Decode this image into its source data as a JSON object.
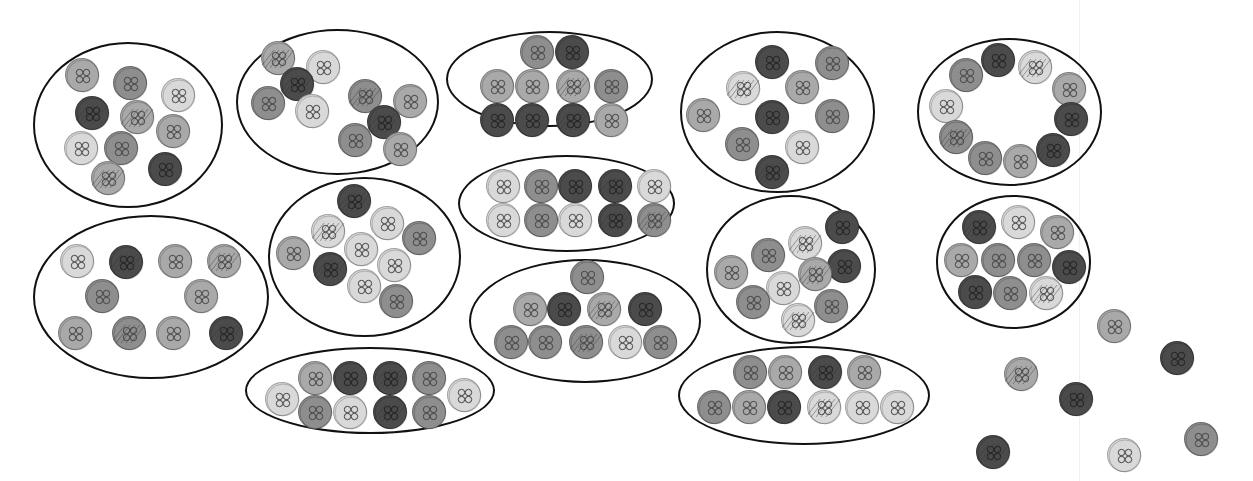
{
  "palette": {
    "light": "#d9d9d9",
    "medium": "#a9a9a9",
    "medium_dark": "#8e8e8e",
    "dark": "#4b4b4b",
    "outline": "#111111",
    "background": "#ffffff"
  },
  "groups": [
    {
      "name": "group-1",
      "oval": {
        "x": 33,
        "y": 42,
        "w": 190,
        "h": 166
      },
      "count": 10
    },
    {
      "name": "group-2",
      "oval": {
        "x": 236,
        "y": 29,
        "w": 203,
        "h": 146
      },
      "count": 10
    },
    {
      "name": "group-3",
      "oval": {
        "x": 446,
        "y": 31,
        "w": 207,
        "h": 96
      },
      "count": 10
    },
    {
      "name": "group-4",
      "oval": {
        "x": 680,
        "y": 31,
        "w": 195,
        "h": 162
      },
      "count": 10
    },
    {
      "name": "group-5",
      "oval": {
        "x": 917,
        "y": 38,
        "w": 185,
        "h": 148
      },
      "count": 10
    },
    {
      "name": "group-6",
      "oval": {
        "x": 33,
        "y": 215,
        "w": 236,
        "h": 164
      },
      "count": 10
    },
    {
      "name": "group-7",
      "oval": {
        "x": 268,
        "y": 177,
        "w": 193,
        "h": 160
      },
      "count": 10
    },
    {
      "name": "group-8",
      "oval": {
        "x": 458,
        "y": 155,
        "w": 217,
        "h": 97
      },
      "count": 10
    },
    {
      "name": "group-9",
      "oval": {
        "x": 469,
        "y": 259,
        "w": 232,
        "h": 124
      },
      "count": 10
    },
    {
      "name": "group-10",
      "oval": {
        "x": 706,
        "y": 195,
        "w": 170,
        "h": 149
      },
      "count": 10
    },
    {
      "name": "group-11",
      "oval": {
        "x": 936,
        "y": 195,
        "w": 155,
        "h": 134
      },
      "count": 10
    },
    {
      "name": "group-12",
      "oval": {
        "x": 245,
        "y": 347,
        "w": 250,
        "h": 87
      },
      "count": 10
    },
    {
      "name": "group-13",
      "oval": {
        "x": 678,
        "y": 346,
        "w": 252,
        "h": 99
      },
      "count": 10
    }
  ],
  "buttons": [
    {
      "x": 82,
      "y": 75,
      "shade": "medium",
      "pattern": false
    },
    {
      "x": 130,
      "y": 83,
      "shade": "medium_dark",
      "pattern": false
    },
    {
      "x": 178,
      "y": 95,
      "shade": "light",
      "pattern": false
    },
    {
      "x": 92,
      "y": 113,
      "shade": "dark",
      "pattern": true
    },
    {
      "x": 137,
      "y": 117,
      "shade": "medium",
      "pattern": true
    },
    {
      "x": 173,
      "y": 131,
      "shade": "medium",
      "pattern": false
    },
    {
      "x": 81,
      "y": 148,
      "shade": "light",
      "pattern": false
    },
    {
      "x": 121,
      "y": 148,
      "shade": "medium_dark",
      "pattern": false
    },
    {
      "x": 108,
      "y": 178,
      "shade": "medium",
      "pattern": true
    },
    {
      "x": 165,
      "y": 169,
      "shade": "dark",
      "pattern": false
    },
    {
      "x": 278,
      "y": 58,
      "shade": "medium",
      "pattern": true
    },
    {
      "x": 323,
      "y": 67,
      "shade": "light",
      "pattern": false
    },
    {
      "x": 297,
      "y": 84,
      "shade": "dark",
      "pattern": true
    },
    {
      "x": 268,
      "y": 103,
      "shade": "medium_dark",
      "pattern": false
    },
    {
      "x": 312,
      "y": 111,
      "shade": "light",
      "pattern": false
    },
    {
      "x": 365,
      "y": 96,
      "shade": "medium_dark",
      "pattern": true
    },
    {
      "x": 410,
      "y": 101,
      "shade": "medium",
      "pattern": false
    },
    {
      "x": 384,
      "y": 122,
      "shade": "dark",
      "pattern": true
    },
    {
      "x": 355,
      "y": 140,
      "shade": "medium_dark",
      "pattern": false
    },
    {
      "x": 400,
      "y": 149,
      "shade": "medium",
      "pattern": false
    },
    {
      "x": 537,
      "y": 52,
      "shade": "medium_dark",
      "pattern": false
    },
    {
      "x": 572,
      "y": 52,
      "shade": "dark",
      "pattern": false
    },
    {
      "x": 497,
      "y": 86,
      "shade": "medium",
      "pattern": false
    },
    {
      "x": 532,
      "y": 86,
      "shade": "medium",
      "pattern": false
    },
    {
      "x": 573,
      "y": 86,
      "shade": "medium",
      "pattern": true
    },
    {
      "x": 611,
      "y": 86,
      "shade": "medium_dark",
      "pattern": false
    },
    {
      "x": 497,
      "y": 120,
      "shade": "dark",
      "pattern": false
    },
    {
      "x": 532,
      "y": 120,
      "shade": "dark",
      "pattern": false
    },
    {
      "x": 573,
      "y": 120,
      "shade": "dark",
      "pattern": true
    },
    {
      "x": 611,
      "y": 120,
      "shade": "medium",
      "pattern": false
    },
    {
      "x": 772,
      "y": 62,
      "shade": "dark",
      "pattern": false
    },
    {
      "x": 832,
      "y": 63,
      "shade": "medium_dark",
      "pattern": false
    },
    {
      "x": 743,
      "y": 88,
      "shade": "light",
      "pattern": true
    },
    {
      "x": 802,
      "y": 87,
      "shade": "medium",
      "pattern": false
    },
    {
      "x": 703,
      "y": 115,
      "shade": "medium",
      "pattern": false
    },
    {
      "x": 772,
      "y": 117,
      "shade": "dark",
      "pattern": false
    },
    {
      "x": 832,
      "y": 116,
      "shade": "medium_dark",
      "pattern": false
    },
    {
      "x": 742,
      "y": 144,
      "shade": "medium_dark",
      "pattern": false
    },
    {
      "x": 802,
      "y": 147,
      "shade": "light",
      "pattern": false
    },
    {
      "x": 772,
      "y": 172,
      "shade": "dark",
      "pattern": true
    },
    {
      "x": 998,
      "y": 60,
      "shade": "dark",
      "pattern": false
    },
    {
      "x": 1035,
      "y": 67,
      "shade": "light",
      "pattern": true
    },
    {
      "x": 966,
      "y": 75,
      "shade": "medium_dark",
      "pattern": false
    },
    {
      "x": 1069,
      "y": 89,
      "shade": "medium",
      "pattern": false
    },
    {
      "x": 946,
      "y": 106,
      "shade": "light",
      "pattern": false
    },
    {
      "x": 1071,
      "y": 119,
      "shade": "dark",
      "pattern": false
    },
    {
      "x": 956,
      "y": 137,
      "shade": "medium_dark",
      "pattern": true
    },
    {
      "x": 1053,
      "y": 150,
      "shade": "dark",
      "pattern": true
    },
    {
      "x": 985,
      "y": 158,
      "shade": "medium_dark",
      "pattern": false
    },
    {
      "x": 1020,
      "y": 161,
      "shade": "medium",
      "pattern": false
    },
    {
      "x": 77,
      "y": 261,
      "shade": "light",
      "pattern": false
    },
    {
      "x": 126,
      "y": 262,
      "shade": "dark",
      "pattern": true
    },
    {
      "x": 175,
      "y": 261,
      "shade": "medium",
      "pattern": false
    },
    {
      "x": 224,
      "y": 261,
      "shade": "medium",
      "pattern": true
    },
    {
      "x": 102,
      "y": 296,
      "shade": "medium_dark",
      "pattern": false
    },
    {
      "x": 201,
      "y": 296,
      "shade": "medium",
      "pattern": false
    },
    {
      "x": 75,
      "y": 333,
      "shade": "medium",
      "pattern": false
    },
    {
      "x": 129,
      "y": 333,
      "shade": "medium_dark",
      "pattern": true
    },
    {
      "x": 173,
      "y": 333,
      "shade": "medium",
      "pattern": false
    },
    {
      "x": 226,
      "y": 333,
      "shade": "dark",
      "pattern": true
    },
    {
      "x": 354,
      "y": 201,
      "shade": "dark",
      "pattern": true
    },
    {
      "x": 328,
      "y": 231,
      "shade": "light",
      "pattern": true
    },
    {
      "x": 387,
      "y": 223,
      "shade": "light",
      "pattern": false
    },
    {
      "x": 419,
      "y": 238,
      "shade": "medium_dark",
      "pattern": false
    },
    {
      "x": 293,
      "y": 253,
      "shade": "medium",
      "pattern": false
    },
    {
      "x": 361,
      "y": 249,
      "shade": "light",
      "pattern": false
    },
    {
      "x": 394,
      "y": 265,
      "shade": "light",
      "pattern": false
    },
    {
      "x": 330,
      "y": 269,
      "shade": "dark",
      "pattern": true
    },
    {
      "x": 364,
      "y": 286,
      "shade": "light",
      "pattern": false
    },
    {
      "x": 396,
      "y": 301,
      "shade": "medium_dark",
      "pattern": false
    },
    {
      "x": 503,
      "y": 186,
      "shade": "light",
      "pattern": false
    },
    {
      "x": 541,
      "y": 186,
      "shade": "medium_dark",
      "pattern": false
    },
    {
      "x": 575,
      "y": 186,
      "shade": "dark",
      "pattern": false
    },
    {
      "x": 615,
      "y": 186,
      "shade": "dark",
      "pattern": true
    },
    {
      "x": 654,
      "y": 186,
      "shade": "light",
      "pattern": false
    },
    {
      "x": 503,
      "y": 220,
      "shade": "light",
      "pattern": false
    },
    {
      "x": 541,
      "y": 220,
      "shade": "medium_dark",
      "pattern": false
    },
    {
      "x": 575,
      "y": 220,
      "shade": "light",
      "pattern": false
    },
    {
      "x": 615,
      "y": 220,
      "shade": "dark",
      "pattern": true
    },
    {
      "x": 654,
      "y": 220,
      "shade": "medium_dark",
      "pattern": true
    },
    {
      "x": 587,
      "y": 277,
      "shade": "medium_dark",
      "pattern": false
    },
    {
      "x": 530,
      "y": 309,
      "shade": "medium",
      "pattern": false
    },
    {
      "x": 564,
      "y": 309,
      "shade": "dark",
      "pattern": false
    },
    {
      "x": 604,
      "y": 309,
      "shade": "medium",
      "pattern": true
    },
    {
      "x": 645,
      "y": 309,
      "shade": "dark",
      "pattern": false
    },
    {
      "x": 511,
      "y": 342,
      "shade": "medium_dark",
      "pattern": false
    },
    {
      "x": 545,
      "y": 342,
      "shade": "medium_dark",
      "pattern": false
    },
    {
      "x": 586,
      "y": 342,
      "shade": "medium_dark",
      "pattern": true
    },
    {
      "x": 625,
      "y": 342,
      "shade": "light",
      "pattern": false
    },
    {
      "x": 660,
      "y": 342,
      "shade": "medium_dark",
      "pattern": false
    },
    {
      "x": 842,
      "y": 227,
      "shade": "dark",
      "pattern": false
    },
    {
      "x": 805,
      "y": 243,
      "shade": "light",
      "pattern": true
    },
    {
      "x": 768,
      "y": 255,
      "shade": "medium_dark",
      "pattern": false
    },
    {
      "x": 844,
      "y": 266,
      "shade": "dark",
      "pattern": false
    },
    {
      "x": 731,
      "y": 272,
      "shade": "medium",
      "pattern": false
    },
    {
      "x": 815,
      "y": 274,
      "shade": "medium",
      "pattern": true
    },
    {
      "x": 783,
      "y": 288,
      "shade": "light",
      "pattern": false
    },
    {
      "x": 753,
      "y": 302,
      "shade": "medium_dark",
      "pattern": false
    },
    {
      "x": 831,
      "y": 306,
      "shade": "medium_dark",
      "pattern": false
    },
    {
      "x": 798,
      "y": 320,
      "shade": "light",
      "pattern": true
    },
    {
      "x": 979,
      "y": 227,
      "shade": "dark",
      "pattern": true
    },
    {
      "x": 1018,
      "y": 222,
      "shade": "light",
      "pattern": false
    },
    {
      "x": 1057,
      "y": 232,
      "shade": "medium",
      "pattern": false
    },
    {
      "x": 961,
      "y": 260,
      "shade": "medium",
      "pattern": false
    },
    {
      "x": 998,
      "y": 260,
      "shade": "medium_dark",
      "pattern": false
    },
    {
      "x": 1034,
      "y": 260,
      "shade": "medium_dark",
      "pattern": false
    },
    {
      "x": 1069,
      "y": 267,
      "shade": "dark",
      "pattern": false
    },
    {
      "x": 975,
      "y": 292,
      "shade": "dark",
      "pattern": false
    },
    {
      "x": 1010,
      "y": 293,
      "shade": "medium_dark",
      "pattern": false
    },
    {
      "x": 1046,
      "y": 293,
      "shade": "light",
      "pattern": true
    },
    {
      "x": 282,
      "y": 399,
      "shade": "light",
      "pattern": false
    },
    {
      "x": 315,
      "y": 378,
      "shade": "medium",
      "pattern": false
    },
    {
      "x": 350,
      "y": 378,
      "shade": "dark",
      "pattern": false
    },
    {
      "x": 390,
      "y": 378,
      "shade": "dark",
      "pattern": true
    },
    {
      "x": 429,
      "y": 378,
      "shade": "medium_dark",
      "pattern": false
    },
    {
      "x": 315,
      "y": 412,
      "shade": "medium_dark",
      "pattern": false
    },
    {
      "x": 350,
      "y": 412,
      "shade": "light",
      "pattern": false
    },
    {
      "x": 390,
      "y": 412,
      "shade": "dark",
      "pattern": true
    },
    {
      "x": 429,
      "y": 412,
      "shade": "medium_dark",
      "pattern": false
    },
    {
      "x": 464,
      "y": 395,
      "shade": "light",
      "pattern": false
    },
    {
      "x": 750,
      "y": 372,
      "shade": "medium_dark",
      "pattern": false
    },
    {
      "x": 785,
      "y": 372,
      "shade": "medium",
      "pattern": false
    },
    {
      "x": 825,
      "y": 372,
      "shade": "dark",
      "pattern": true
    },
    {
      "x": 864,
      "y": 372,
      "shade": "medium",
      "pattern": false
    },
    {
      "x": 714,
      "y": 407,
      "shade": "medium_dark",
      "pattern": false
    },
    {
      "x": 749,
      "y": 407,
      "shade": "medium",
      "pattern": false
    },
    {
      "x": 784,
      "y": 407,
      "shade": "dark",
      "pattern": false
    },
    {
      "x": 824,
      "y": 407,
      "shade": "light",
      "pattern": true
    },
    {
      "x": 862,
      "y": 407,
      "shade": "light",
      "pattern": false
    },
    {
      "x": 897,
      "y": 407,
      "shade": "light",
      "pattern": false
    },
    {
      "x": 1114,
      "y": 326,
      "shade": "medium",
      "pattern": false
    },
    {
      "x": 1177,
      "y": 358,
      "shade": "dark",
      "pattern": false
    },
    {
      "x": 1021,
      "y": 374,
      "shade": "medium",
      "pattern": true
    },
    {
      "x": 1076,
      "y": 399,
      "shade": "dark",
      "pattern": true
    },
    {
      "x": 993,
      "y": 452,
      "shade": "dark",
      "pattern": true
    },
    {
      "x": 1124,
      "y": 455,
      "shade": "light",
      "pattern": false
    },
    {
      "x": 1201,
      "y": 439,
      "shade": "medium_dark",
      "pattern": false
    }
  ],
  "loose_buttons_count": 7,
  "total_groups": 13
}
